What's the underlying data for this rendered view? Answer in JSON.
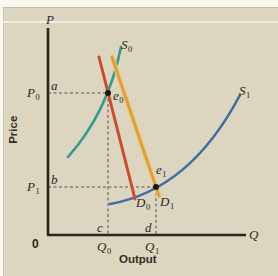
{
  "page": {
    "background": "#faf8f1",
    "panel_background": "#dcd5c0"
  },
  "colors": {
    "axis": "#2a2420",
    "dashed_guide": "#57534a",
    "supply_s0": "#339a8e",
    "supply_s1": "#3e6ea3",
    "demand_d0": "#ce4a2d",
    "demand_d1": "#dd9a3e",
    "demand_d1_halo": "#eec873",
    "equilibrium_dot": "#1b1713"
  },
  "axes": {
    "y_var": "P",
    "x_var": "Q",
    "y_title": "Price",
    "x_title": "Output",
    "origin": "0"
  },
  "labels": {
    "s0": {
      "base": "S",
      "sub": "0"
    },
    "s1": {
      "base": "S",
      "sub": "1"
    },
    "d0": {
      "base": "D",
      "sub": "0"
    },
    "d1": {
      "base": "D",
      "sub": "1"
    },
    "e0": {
      "base": "e",
      "sub": "0"
    },
    "e1": {
      "base": "e",
      "sub": "1"
    },
    "p0": {
      "base": "P",
      "sub": "0"
    },
    "p1": {
      "base": "P",
      "sub": "1"
    },
    "q0": {
      "base": "Q",
      "sub": "0"
    },
    "q1": {
      "base": "Q",
      "sub": "1"
    },
    "a": "a",
    "b": "b",
    "c": "c",
    "d": "d"
  },
  "diagram": {
    "kind": "supply-demand",
    "curves": [
      {
        "id": "S0",
        "role": "supply",
        "shape": "upward-sloping, steep, upper-left",
        "color": "#339a8e"
      },
      {
        "id": "S1",
        "role": "supply",
        "shape": "upward-sloping convex, lower-right",
        "color": "#3e6ea3"
      },
      {
        "id": "D0",
        "role": "demand",
        "shape": "steep downward-sloping line",
        "color": "#ce4a2d"
      },
      {
        "id": "D1",
        "role": "demand",
        "shape": "steep downward-sloping line, right of D0",
        "color": "#dd9a3e"
      }
    ],
    "equilibria": [
      {
        "id": "e0",
        "on_curves": [
          "S0",
          "D0"
        ],
        "price_label": "P0",
        "price_axis_point": "a",
        "quantity_label": "Q0",
        "quantity_axis_point": "c"
      },
      {
        "id": "e1",
        "on_curves": [
          "S1",
          "D1"
        ],
        "price_label": "P1",
        "price_axis_point": "b",
        "quantity_label": "Q1",
        "quantity_axis_point": "d"
      }
    ]
  }
}
